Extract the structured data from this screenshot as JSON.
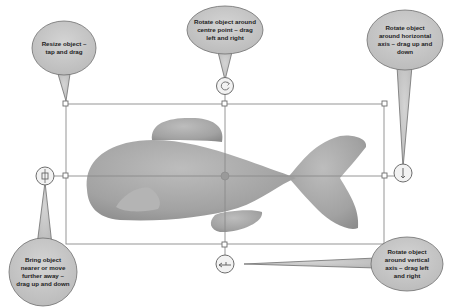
{
  "diagram": {
    "colors": {
      "callout_fill": "#c8c8c8",
      "callout_stroke": "#6e6e6e",
      "frame_line": "#8a8a8a",
      "fish_fill": "#a9a9a9",
      "handle_fill": "#ffffff"
    },
    "callouts": [
      {
        "id": "resize",
        "text": "Resize object – tap and drag"
      },
      {
        "id": "rotate-centre",
        "text": "Rotate object around centre point – drag left and right"
      },
      {
        "id": "rotate-horizontal",
        "text": "Rotate object around horizontal axis – drag up and down"
      },
      {
        "id": "depth",
        "text": "Bring object nearer or move further away – drag up and down"
      },
      {
        "id": "rotate-vertical",
        "text": "Rotate object around vertical axis – drag left and right"
      }
    ],
    "handles": [
      {
        "id": "rotate-centre-handle",
        "icon": "circular-arrow"
      },
      {
        "id": "rotate-horizontal-handle",
        "icon": "vertical-arrow"
      },
      {
        "id": "depth-handle",
        "icon": "depth-arrows"
      },
      {
        "id": "rotate-vertical-handle",
        "icon": "horizontal-arrow"
      }
    ]
  }
}
